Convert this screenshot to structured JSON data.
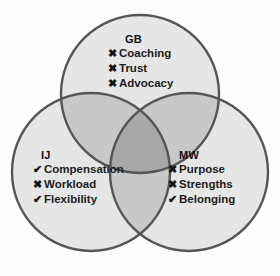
{
  "diagram": {
    "type": "venn-3-circle",
    "background_color": "#fdfdfd",
    "circle_fill": "#e6e6e6",
    "overlap_pair_fill": "#c8c8c8",
    "overlap_center_fill": "#a8a8a8",
    "stroke_color": "#555555",
    "mark_check": "✔",
    "mark_cross": "✖",
    "groups": [
      {
        "id": "gb",
        "label": "GB",
        "items": [
          {
            "mark": "✖",
            "status": "cross",
            "text": "Coaching"
          },
          {
            "mark": "✖",
            "status": "cross",
            "text": "Trust"
          },
          {
            "mark": "✖",
            "status": "cross",
            "text": "Advocacy"
          }
        ]
      },
      {
        "id": "ij",
        "label": "IJ",
        "items": [
          {
            "mark": "✔",
            "status": "check",
            "text": "Compensation"
          },
          {
            "mark": "✖",
            "status": "cross",
            "text": "Workload"
          },
          {
            "mark": "✔",
            "status": "check",
            "text": "Flexibility"
          }
        ]
      },
      {
        "id": "mw",
        "label": "MW",
        "items": [
          {
            "mark": "✖",
            "status": "cross",
            "text": "Purpose"
          },
          {
            "mark": "✖",
            "status": "cross",
            "text": "Strengths"
          },
          {
            "mark": "✔",
            "status": "check",
            "text": "Belonging"
          }
        ]
      }
    ]
  }
}
